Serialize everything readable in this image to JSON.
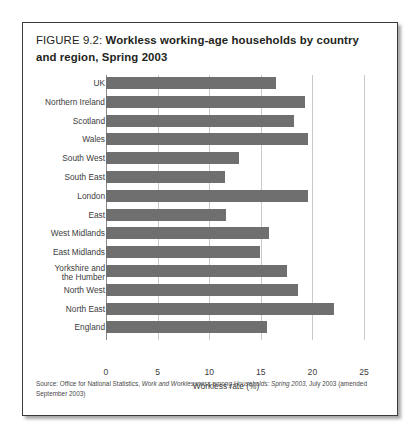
{
  "figure": {
    "label": "FIGURE 9.2:",
    "caption": "Workless working-age households by country and region, Spring 2003",
    "source_prefix": "Source: Office for National Statistics, ",
    "source_italic": "Work and Worklessness among Households: Spring 2003",
    "source_suffix": ", July 2003 (amended September 2003)"
  },
  "colors": {
    "bar": "#6f6f6f",
    "gridline": "#c9c9c9",
    "axis": "#8a8a8a",
    "text": "#3c3c3c",
    "border": "#3a3a3a"
  },
  "chart_data": {
    "type": "bar",
    "orientation": "horizontal",
    "title": "Workless working-age households by country and region, Spring 2003",
    "xlabel": "Workless rate (%)",
    "ylabel": "",
    "xlim": [
      0,
      25
    ],
    "xticks": [
      0,
      5,
      10,
      15,
      20,
      25
    ],
    "xtick_labels": [
      "0",
      "5",
      "10",
      "15",
      "20",
      "25"
    ],
    "grid": true,
    "legend": false,
    "categories": [
      "UK",
      "Northern Ireland",
      "Scotland",
      "Wales",
      "South West",
      "South East",
      "London",
      "East",
      "West Midlands",
      "East Midlands",
      "Yorkshire and\nthe Humber",
      "North West",
      "North East",
      "England"
    ],
    "values": [
      16.5,
      19.3,
      18.2,
      19.6,
      12.9,
      11.5,
      19.6,
      11.6,
      15.8,
      14.9,
      17.5,
      18.6,
      22.1,
      15.6
    ]
  }
}
